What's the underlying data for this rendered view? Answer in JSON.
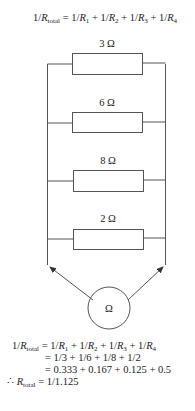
{
  "formula_top": {
    "lhs_prefix": "1/",
    "lhs_var": "R",
    "lhs_sub": "total",
    "rhs": [
      {
        "prefix": "1/",
        "var": "R",
        "sub": "1"
      },
      {
        "prefix": "1/",
        "var": "R",
        "sub": "2"
      },
      {
        "prefix": "1/",
        "var": "R",
        "sub": "3"
      },
      {
        "prefix": "1/",
        "var": "R",
        "sub": "4"
      }
    ]
  },
  "resistors": [
    {
      "label": "3 Ω",
      "value_ohms": 3
    },
    {
      "label": "6 Ω",
      "value_ohms": 6
    },
    {
      "label": "8 Ω",
      "value_ohms": 8
    },
    {
      "label": "2 Ω",
      "value_ohms": 2
    }
  ],
  "meter": {
    "symbol": "Ω",
    "name": "ohmmeter"
  },
  "calculation": {
    "line1_rhs": "= 1/3 + 1/6 + 1/8 + 1/2",
    "line2_rhs": "= 0.333 + 0.167 + 0.125 + 0.5",
    "therefore_symbol": "∴",
    "result_rhs": "= 1/1.125"
  },
  "colors": {
    "line": "#555555",
    "text": "#222222",
    "background": "#ffffff"
  }
}
